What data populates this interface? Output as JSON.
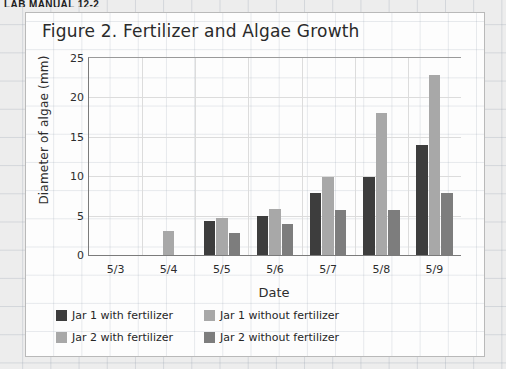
{
  "page_header": "LAB MANUAL 12-2",
  "panel": {
    "title": "Figure 2. Fertilizer and Algae Growth"
  },
  "chart_data": {
    "type": "bar",
    "title": "Figure 2. Fertilizer and Algae Growth",
    "xlabel": "Date",
    "ylabel": "Diameter of algae (mm)",
    "categories": [
      "5/3",
      "5/4",
      "5/5",
      "5/6",
      "5/7",
      "5/8",
      "5/9"
    ],
    "ylim": [
      0,
      25
    ],
    "yticks": [
      0,
      5,
      10,
      15,
      20,
      25
    ],
    "grid": true,
    "legend_position": "bottom-left",
    "series": [
      {
        "name": "Jar 1 with fertilizer",
        "color": "#3d3d3d",
        "values": [
          0,
          0,
          4.3,
          4.9,
          7.9,
          9.9,
          13.9
        ]
      },
      {
        "name": "Jar 1 without fertilizer",
        "color": "#a8a8a8",
        "values": [
          0,
          0,
          4.7,
          5.9,
          9.9,
          18.0,
          22.9
        ]
      },
      {
        "name": "Jar 2 with fertilizer",
        "color": "#a8a8a8",
        "values": [
          0,
          3.0,
          0,
          0,
          0,
          0,
          0
        ]
      },
      {
        "name": "Jar 2 without fertilizer",
        "color": "#7d7d7d",
        "values": [
          0,
          0,
          2.8,
          3.9,
          5.7,
          5.7,
          7.9
        ]
      }
    ]
  },
  "legend": [
    {
      "label": "Jar 1 with fertilizer",
      "color": "#3d3d3d"
    },
    {
      "label": "Jar 1 without fertilizer",
      "color": "#a8a8a8"
    },
    {
      "label": "Jar 2 with fertilizer",
      "color": "#a8a8a8"
    },
    {
      "label": "Jar 2 without fertilizer",
      "color": "#7d7d7d"
    }
  ]
}
